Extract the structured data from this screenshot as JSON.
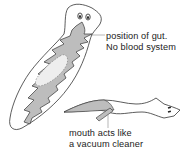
{
  "diagram": {
    "colors": {
      "outline": "#333333",
      "gut_fill": "#bdbdbd",
      "body_fill": "#ffffff",
      "pointer_line": "#888888"
    },
    "labels": {
      "gut": {
        "line1": "position of gut.",
        "line2": "No blood system"
      },
      "mouth": {
        "line1": "mouth acts like",
        "line2": "a vacuum cleaner"
      }
    },
    "figures": [
      {
        "name": "flatworm-dorsal-view",
        "shows": [
          "eyes",
          "branched gut",
          "pharynx"
        ]
      },
      {
        "name": "flatworm-side-view-feeding",
        "shows": [
          "extended pharynx",
          "eyes"
        ]
      }
    ]
  }
}
